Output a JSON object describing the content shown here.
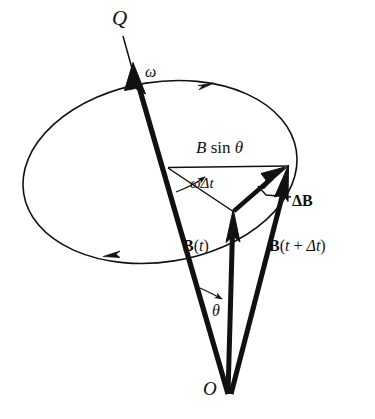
{
  "figure": {
    "type": "vector-precession-diagram",
    "width": 375,
    "height": 419,
    "background": "#ffffff",
    "stroke": "#111111"
  },
  "labels": {
    "axis_top": "Q",
    "angular_velocity": "ω",
    "radius_chord": {
      "pre": "B",
      "mid": " sin ",
      "post": "θ"
    },
    "rotation_angle": {
      "omega": "ω",
      "delta_t": "Δt"
    },
    "delta_B": "ΔB",
    "B_t": {
      "bold": "B",
      "paren_open": "(",
      "arg": "t",
      "paren_close": ")"
    },
    "B_t_dt": {
      "bold": "B",
      "paren_open": "(",
      "arg": "t",
      "plus": " + ",
      "arg2": "Δt",
      "paren_close": ")"
    },
    "cone_angle": "θ",
    "origin": "O"
  },
  "geometry": {
    "origin_point": [
      228,
      394
    ],
    "axis_tip": [
      126,
      60
    ],
    "axis_label_point": [
      122,
      24
    ],
    "ellipse_center": [
      160,
      172
    ],
    "circle_top_point": [
      168,
      167
    ],
    "B_t_tip": [
      233,
      212
    ],
    "B_t_dt_tip": [
      288,
      167
    ],
    "chord_left": [
      168,
      168
    ],
    "chord_right": [
      287,
      166
    ],
    "delta_B_from": [
      234,
      212
    ],
    "delta_B_to": [
      285,
      170
    ],
    "rotation_arc_angle_deg": 28,
    "cone_half_angle_deg": 14
  },
  "colors": {
    "ink": "#111111",
    "paper": "#ffffff"
  }
}
